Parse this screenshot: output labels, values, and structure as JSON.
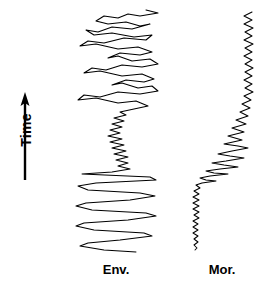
{
  "figure": {
    "background_color": "#ffffff",
    "line_color": "#000000",
    "width": 278,
    "height": 289
  },
  "axis": {
    "time_label": "Time",
    "arrow_direction": "up",
    "arrow_name": "time-arrow-icon"
  },
  "traces": [
    {
      "id": "env",
      "label": "Env.",
      "center_x": 117
    },
    {
      "id": "mor",
      "label": "Mor.",
      "center_x": 222
    }
  ],
  "chart_data": {
    "type": "line",
    "title": "",
    "xlabel": "",
    "ylabel": "Time",
    "orientation": "vertical-time-upward",
    "grid": false,
    "legend_position": "below-axis",
    "axis_annotation": {
      "label": "Time",
      "arrow": "up",
      "x": 25,
      "y_from": 180,
      "y_to": 95
    },
    "series": [
      {
        "name": "Env.",
        "label": "Env.",
        "baseline_x": 117,
        "y_range": [
          10,
          252
        ],
        "description": "High-amplitude oscillatory envelope trace with a low-amplitude high-frequency waist near the middle",
        "points": [
          [
            146,
            10
          ],
          [
            158,
            13
          ],
          [
            140,
            16
          ],
          [
            128,
            14
          ],
          [
            118,
            18
          ],
          [
            104,
            16
          ],
          [
            96,
            21
          ],
          [
            108,
            24
          ],
          [
            126,
            22
          ],
          [
            140,
            26
          ],
          [
            150,
            24
          ],
          [
            132,
            29
          ],
          [
            112,
            27
          ],
          [
            98,
            32
          ],
          [
            86,
            30
          ],
          [
            94,
            35
          ],
          [
            112,
            33
          ],
          [
            134,
            37
          ],
          [
            152,
            35
          ],
          [
            146,
            40
          ],
          [
            124,
            38
          ],
          [
            104,
            43
          ],
          [
            88,
            41
          ],
          [
            80,
            46
          ],
          [
            96,
            44
          ],
          [
            118,
            49
          ],
          [
            138,
            47
          ],
          [
            152,
            52
          ],
          [
            140,
            55
          ],
          [
            120,
            53
          ],
          [
            108,
            58
          ],
          [
            118,
            56
          ],
          [
            132,
            61
          ],
          [
            150,
            59
          ],
          [
            158,
            64
          ],
          [
            142,
            67
          ],
          [
            122,
            65
          ],
          [
            106,
            70
          ],
          [
            92,
            68
          ],
          [
            84,
            73
          ],
          [
            100,
            71
          ],
          [
            122,
            76
          ],
          [
            142,
            74
          ],
          [
            154,
            79
          ],
          [
            144,
            82
          ],
          [
            126,
            80
          ],
          [
            112,
            85
          ],
          [
            122,
            83
          ],
          [
            138,
            88
          ],
          [
            152,
            86
          ],
          [
            158,
            91
          ],
          [
            140,
            94
          ],
          [
            118,
            92
          ],
          [
            100,
            97
          ],
          [
            84,
            95
          ],
          [
            78,
            100
          ],
          [
            96,
            98
          ],
          [
            118,
            103
          ],
          [
            136,
            101
          ],
          [
            148,
            106
          ],
          [
            134,
            109
          ],
          [
            120,
            112
          ],
          [
            126,
            115
          ],
          [
            114,
            118
          ],
          [
            124,
            121
          ],
          [
            112,
            124
          ],
          [
            122,
            127
          ],
          [
            110,
            130
          ],
          [
            120,
            133
          ],
          [
            108,
            136
          ],
          [
            122,
            139
          ],
          [
            110,
            142
          ],
          [
            124,
            145
          ],
          [
            112,
            148
          ],
          [
            126,
            151
          ],
          [
            114,
            154
          ],
          [
            128,
            157
          ],
          [
            116,
            160
          ],
          [
            128,
            163
          ],
          [
            118,
            166
          ],
          [
            130,
            169
          ],
          [
            112,
            172
          ],
          [
            82,
            174
          ],
          [
            150,
            177
          ],
          [
            156,
            180
          ],
          [
            96,
            183
          ],
          [
            78,
            186
          ],
          [
            88,
            190
          ],
          [
            140,
            193
          ],
          [
            155,
            196
          ],
          [
            130,
            200
          ],
          [
            86,
            203
          ],
          [
            76,
            206
          ],
          [
            92,
            210
          ],
          [
            146,
            213
          ],
          [
            156,
            216
          ],
          [
            128,
            220
          ],
          [
            84,
            223
          ],
          [
            76,
            226
          ],
          [
            94,
            230
          ],
          [
            144,
            233
          ],
          [
            152,
            236
          ],
          [
            120,
            240
          ],
          [
            88,
            243
          ],
          [
            80,
            246
          ],
          [
            104,
            250
          ],
          [
            136,
            252
          ]
        ]
      },
      {
        "name": "Mor.",
        "label": "Mor.",
        "baseline_x": 196,
        "y_range": [
          12,
          250
        ],
        "description": "Narrow high-frequency trace at top, a diagonal transition sweep in the middle, and a thin low-amplitude jitter line at the bottom",
        "points": [
          [
            252,
            12
          ],
          [
            244,
            16
          ],
          [
            252,
            20
          ],
          [
            244,
            24
          ],
          [
            253,
            28
          ],
          [
            245,
            32
          ],
          [
            252,
            36
          ],
          [
            244,
            40
          ],
          [
            253,
            44
          ],
          [
            245,
            48
          ],
          [
            252,
            52
          ],
          [
            244,
            56
          ],
          [
            252,
            60
          ],
          [
            245,
            64
          ],
          [
            253,
            68
          ],
          [
            245,
            72
          ],
          [
            252,
            76
          ],
          [
            244,
            80
          ],
          [
            252,
            84
          ],
          [
            245,
            88
          ],
          [
            253,
            92
          ],
          [
            244,
            96
          ],
          [
            251,
            100
          ],
          [
            242,
            104
          ],
          [
            250,
            108
          ],
          [
            240,
            112
          ],
          [
            248,
            116
          ],
          [
            236,
            120
          ],
          [
            246,
            124
          ],
          [
            232,
            128
          ],
          [
            244,
            132
          ],
          [
            228,
            136
          ],
          [
            242,
            140
          ],
          [
            224,
            144
          ],
          [
            238,
            146
          ],
          [
            248,
            148
          ],
          [
            232,
            151
          ],
          [
            218,
            154
          ],
          [
            230,
            156
          ],
          [
            244,
            158
          ],
          [
            226,
            161
          ],
          [
            212,
            163
          ],
          [
            224,
            165
          ],
          [
            238,
            167
          ],
          [
            220,
            169
          ],
          [
            206,
            171
          ],
          [
            214,
            173
          ],
          [
            228,
            174
          ],
          [
            210,
            176
          ],
          [
            200,
            178
          ],
          [
            206,
            180
          ],
          [
            216,
            181
          ],
          [
            202,
            183
          ],
          [
            196,
            185
          ],
          [
            200,
            188
          ],
          [
            194,
            191
          ],
          [
            199,
            194
          ],
          [
            193,
            197
          ],
          [
            199,
            200
          ],
          [
            193,
            203
          ],
          [
            199,
            206
          ],
          [
            193,
            209
          ],
          [
            199,
            212
          ],
          [
            194,
            215
          ],
          [
            199,
            218
          ],
          [
            193,
            221
          ],
          [
            198,
            224
          ],
          [
            193,
            227
          ],
          [
            198,
            230
          ],
          [
            193,
            233
          ],
          [
            198,
            236
          ],
          [
            194,
            239
          ],
          [
            198,
            242
          ],
          [
            194,
            245
          ],
          [
            197,
            248
          ],
          [
            195,
            250
          ]
        ]
      }
    ]
  }
}
